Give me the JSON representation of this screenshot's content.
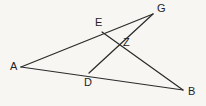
{
  "figure": {
    "kind": "geometry-diagram",
    "background_color": "#f7f6f3",
    "line_color": "#2b2b2b",
    "label_color": "#232323",
    "width": 206,
    "height": 106,
    "points": [
      {
        "id": "A",
        "label": "A",
        "x": 21,
        "y": 67,
        "label_x": 10,
        "label_y": 61
      },
      {
        "id": "G",
        "label": "G",
        "x": 153,
        "y": 14,
        "label_x": 157,
        "label_y": 3
      },
      {
        "id": "B",
        "label": "B",
        "x": 183,
        "y": 90,
        "label_x": 188,
        "label_y": 86
      },
      {
        "id": "E",
        "label": "E",
        "x": 102,
        "y": 32,
        "label_x": 95,
        "label_y": 17
      },
      {
        "id": "D",
        "label": "D",
        "x": 89,
        "y": 73,
        "label_x": 84,
        "label_y": 77
      },
      {
        "id": "Z",
        "label": "Z",
        "x": 118,
        "y": 43,
        "label_x": 123,
        "label_y": 37
      }
    ],
    "segments": [
      {
        "id": "AG",
        "from": "A",
        "to": "G",
        "path": "M21,67 L153,14"
      },
      {
        "id": "AB",
        "from": "A",
        "to": "B",
        "path": "M21,67 L183,90"
      },
      {
        "id": "EB",
        "from": "E",
        "to": "B",
        "path": "M102,32 L183,90"
      },
      {
        "id": "DG",
        "from": "D",
        "to": "G",
        "path": "M89,73 L153,14"
      }
    ]
  }
}
